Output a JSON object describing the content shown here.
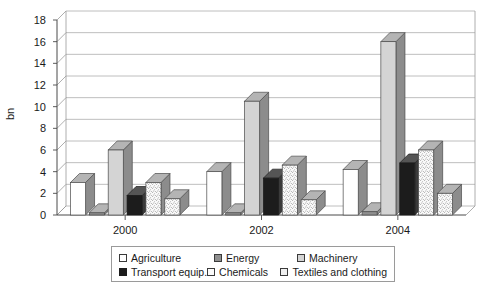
{
  "chart_data": {
    "type": "bar",
    "title": "",
    "subtitle": "",
    "xlabel": "",
    "ylabel": "bn",
    "categories": [
      "2000",
      "2002",
      "2004"
    ],
    "ylim": [
      0,
      18
    ],
    "yticks": [
      0,
      2,
      4,
      6,
      8,
      10,
      12,
      14,
      16,
      18
    ],
    "ytick_labels": [
      "0",
      "2",
      "4",
      "6",
      "8",
      "10",
      "12",
      "14",
      "16",
      "18"
    ],
    "grid": "horizontal",
    "legend_position": "bottom",
    "style": "3d-columns",
    "series": [
      {
        "name": "Agriculture",
        "values": [
          3.0,
          4.0,
          4.2
        ],
        "color": "#ffffff",
        "edge": "#4a4a4a",
        "pattern": "solid"
      },
      {
        "name": "Energy",
        "values": [
          0.2,
          0.2,
          0.3
        ],
        "color": "#8f8f8f",
        "edge": "#4a4a4a",
        "pattern": "solid"
      },
      {
        "name": "Machinery",
        "values": [
          6.0,
          10.5,
          16.0
        ],
        "color": "#d4d4d4",
        "edge": "#4a4a4a",
        "pattern": "solid"
      },
      {
        "name": "Transport equip.",
        "values": [
          1.8,
          3.4,
          4.8
        ],
        "color": "#1c1c1c",
        "edge": "#1c1c1c",
        "pattern": "solid"
      },
      {
        "name": "Chemicals",
        "values": [
          3.0,
          4.6,
          6.0
        ],
        "color": "#f2f2f2",
        "edge": "#4a4a4a",
        "pattern": "speckle"
      },
      {
        "name": "Textiles and clothing",
        "values": [
          1.5,
          1.4,
          2.0
        ],
        "color": "#ececec",
        "edge": "#4a4a4a",
        "pattern": "speckle"
      }
    ]
  },
  "legend": {
    "items": [
      {
        "label": "Agriculture"
      },
      {
        "label": "Energy"
      },
      {
        "label": "Machinery"
      },
      {
        "label": "Transport equip."
      },
      {
        "label": "Chemicals"
      },
      {
        "label": "Textiles and clothing"
      }
    ]
  }
}
